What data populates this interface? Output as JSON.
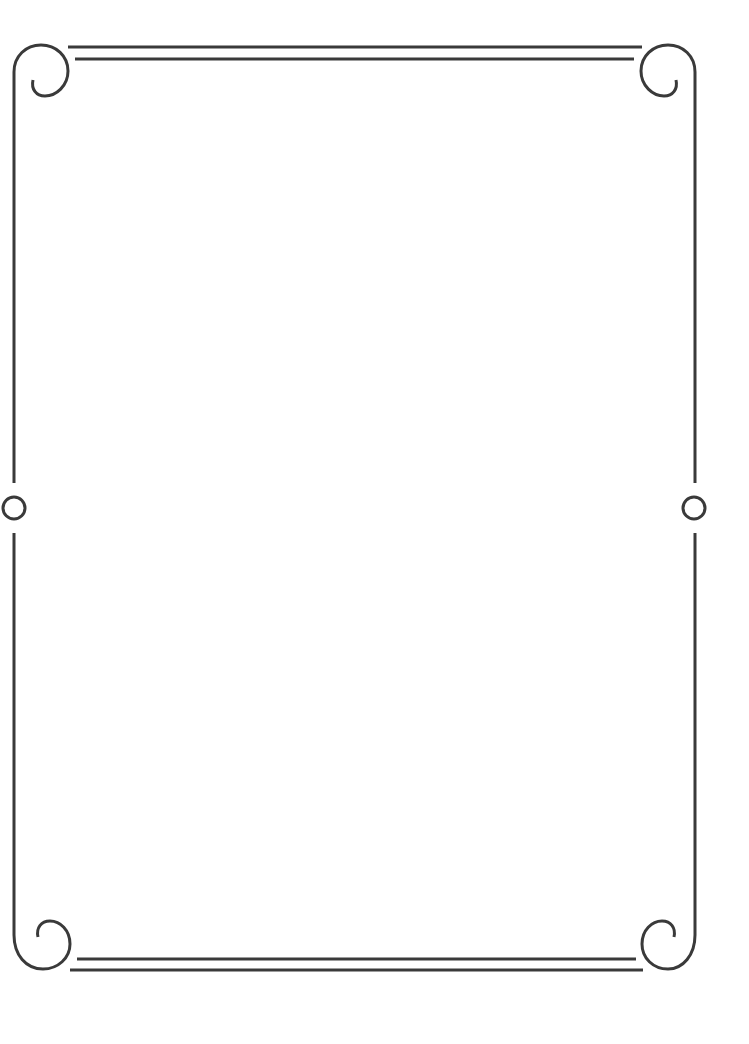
{
  "page": {
    "width": 749,
    "height": 1044,
    "background": "#ffffff"
  },
  "frame": {
    "stroke_color": "#3a3a3a",
    "stroke_width": 3,
    "left_line_x": 14,
    "right_line_x": 695,
    "top_lines": [
      {
        "y": 47,
        "x1": 68,
        "x2": 642
      },
      {
        "y": 59,
        "x1": 75,
        "x2": 634
      }
    ],
    "bottom_lines": [
      {
        "y": 959,
        "x1": 77,
        "x2": 636
      },
      {
        "y": 970,
        "x1": 70,
        "x2": 643
      }
    ],
    "side_circles": [
      {
        "name": "left-circle",
        "cx": 14,
        "cy": 508,
        "r": 11
      },
      {
        "name": "right-circle",
        "cx": 694,
        "cy": 508,
        "r": 11
      }
    ],
    "corner_swirls": [
      "top-left",
      "top-right",
      "bottom-left",
      "bottom-right"
    ]
  }
}
